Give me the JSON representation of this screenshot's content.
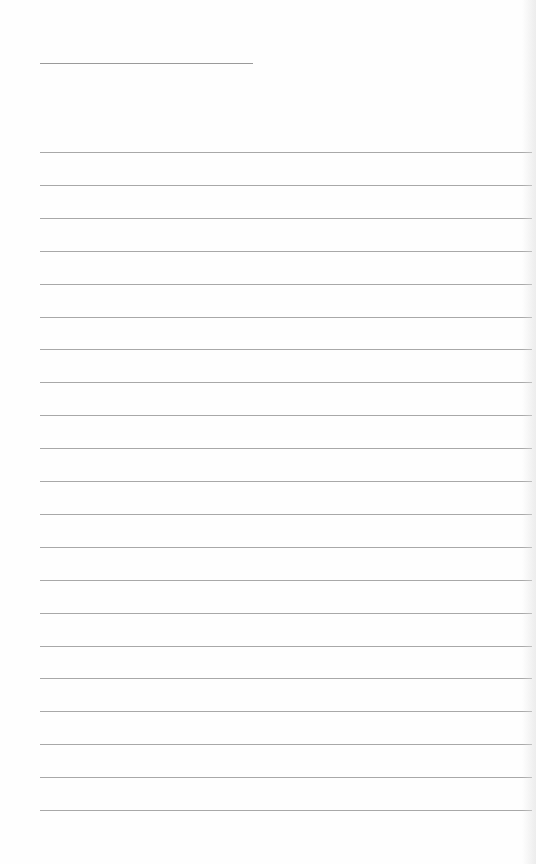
{
  "sheet": {
    "type": "lined-paper",
    "background": "#fefefe",
    "title_line": {
      "x": 40,
      "y": 63,
      "width": 213,
      "color": "#9a9a9a"
    },
    "rules": {
      "count": 21,
      "x": 40,
      "width": 492,
      "first_y": 152,
      "spacing": 32.9,
      "color": "#a8a8a8"
    }
  }
}
